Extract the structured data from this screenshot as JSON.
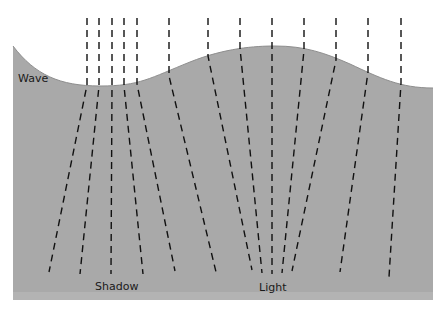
{
  "diagram": {
    "colors": {
      "water": "#a9a9a9",
      "water_edge": "#8e8e8e",
      "ray": "#111111",
      "background": "#ffffff"
    },
    "labels": {
      "wave": "Wave",
      "shadow": "Shadow",
      "light": "Light"
    },
    "rays": [
      {
        "x_top": 87,
        "x_surface": 87,
        "y_surface": 85,
        "x_bottom": 49,
        "y_bottom": 272
      },
      {
        "x_top": 99,
        "x_surface": 99,
        "y_surface": 86,
        "x_bottom": 80,
        "y_bottom": 274
      },
      {
        "x_top": 112,
        "x_surface": 112,
        "y_surface": 86,
        "x_bottom": 111,
        "y_bottom": 274
      },
      {
        "x_top": 124,
        "x_surface": 124,
        "y_surface": 86,
        "x_bottom": 143,
        "y_bottom": 274
      },
      {
        "x_top": 137,
        "x_surface": 137,
        "y_surface": 84,
        "x_bottom": 175,
        "y_bottom": 271
      },
      {
        "x_top": 169,
        "x_surface": 169,
        "y_surface": 76,
        "x_bottom": 216,
        "y_bottom": 272
      },
      {
        "x_top": 208,
        "x_surface": 208,
        "y_surface": 56,
        "x_bottom": 252,
        "y_bottom": 270
      },
      {
        "x_top": 240,
        "x_surface": 240,
        "y_surface": 48,
        "x_bottom": 262,
        "y_bottom": 273
      },
      {
        "x_top": 272,
        "x_surface": 272,
        "y_surface": 46,
        "x_bottom": 272,
        "y_bottom": 274
      },
      {
        "x_top": 304,
        "x_surface": 304,
        "y_surface": 50,
        "x_bottom": 282,
        "y_bottom": 273
      },
      {
        "x_top": 336,
        "x_surface": 336,
        "y_surface": 60,
        "x_bottom": 292,
        "y_bottom": 271
      },
      {
        "x_top": 368,
        "x_surface": 368,
        "y_surface": 72,
        "x_bottom": 340,
        "y_bottom": 272
      },
      {
        "x_top": 401,
        "x_surface": 401,
        "y_surface": 83,
        "x_bottom": 389,
        "y_bottom": 277
      }
    ]
  }
}
